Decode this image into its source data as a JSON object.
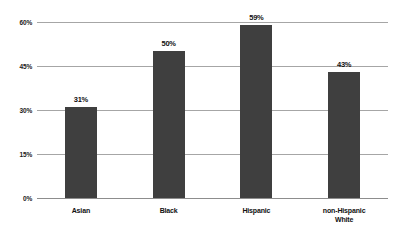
{
  "chart_data": {
    "type": "bar",
    "title": "",
    "subtitle": "",
    "xlabel": "",
    "ylabel": "",
    "categories": [
      "Asian",
      "Black",
      "Hispanic",
      "non-Hispanic\nWhite"
    ],
    "values": [
      31,
      50,
      59,
      43
    ],
    "value_labels": [
      "31%",
      "50%",
      "59%",
      "43%"
    ],
    "ylim": [
      0,
      60
    ],
    "yticks": [
      0,
      15,
      30,
      45,
      60
    ],
    "ytick_labels": [
      "0%",
      "15%",
      "30%",
      "45%",
      "60%"
    ],
    "grid": true,
    "legend": false,
    "legend_position": "none",
    "series": [
      {
        "name": "",
        "values": [
          31,
          50,
          59,
          43
        ]
      }
    ],
    "colors": {
      "bar": "#3f3f3f",
      "gridline": "#a6a6a6",
      "baseline": "#8d8d8d",
      "label_text": "#111111",
      "background": "#ffffff"
    }
  }
}
